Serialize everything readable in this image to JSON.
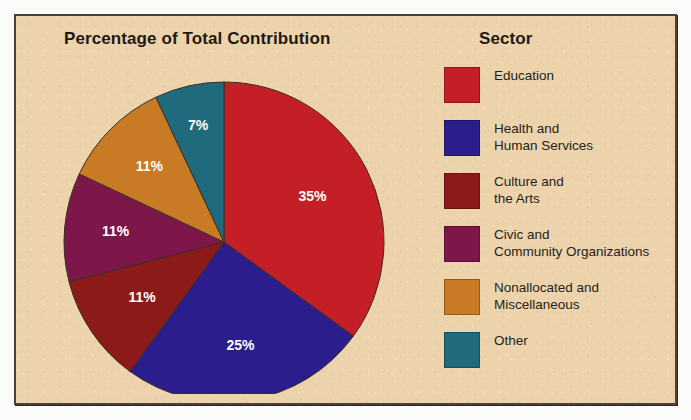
{
  "figure": {
    "background_color": "#edd3ac",
    "border_color": "#4a4238",
    "heading_left": "Percentage of Total Contribution",
    "heading_right": "Sector"
  },
  "chart_data": {
    "type": "pie",
    "title": "Percentage of Total Contribution",
    "legend_title": "Sector",
    "legend_position": "right",
    "start_angle_deg": 0,
    "direction": "clockwise",
    "units": "percent",
    "categories": [
      "Education",
      "Health and Human Services",
      "Culture and the Arts",
      "Civic and Community Organizations",
      "Nonallocated and Miscellaneous",
      "Other"
    ],
    "values": [
      35,
      25,
      11,
      11,
      11,
      7
    ],
    "labels": [
      "35%",
      "25%",
      "11%",
      "11%",
      "11%",
      "7%"
    ],
    "colors": [
      "#c41f26",
      "#2b1e8c",
      "#8b1a18",
      "#7d1649",
      "#c87a24",
      "#1f6b7d"
    ],
    "slices": [
      {
        "name": "Education",
        "value": 35,
        "label": "35%",
        "color": "#c41f26",
        "legend_label": "Education"
      },
      {
        "name": "Health and Human Services",
        "value": 25,
        "label": "25%",
        "color": "#2b1e8c",
        "legend_label": "Health and\nHuman Services"
      },
      {
        "name": "Culture and the Arts",
        "value": 11,
        "label": "11%",
        "color": "#8b1a18",
        "legend_label": "Culture and\nthe Arts"
      },
      {
        "name": "Civic and Community Organizations",
        "value": 11,
        "label": "11%",
        "color": "#7d1649",
        "legend_label": "Civic and\nCommunity Organizations"
      },
      {
        "name": "Nonallocated and Miscellaneous",
        "value": 11,
        "label": "11%",
        "color": "#c87a24",
        "legend_label": "Nonallocated and\nMiscellaneous"
      },
      {
        "name": "Other",
        "value": 7,
        "label": "7%",
        "color": "#1f6b7d",
        "legend_label": "Other"
      }
    ]
  }
}
